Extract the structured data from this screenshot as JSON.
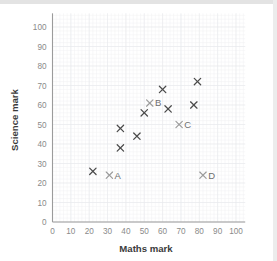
{
  "chart_data": {
    "type": "scatter",
    "title": "",
    "xlabel": "Maths mark",
    "ylabel": "Science mark",
    "xlim": [
      0,
      105
    ],
    "ylim": [
      0,
      107
    ],
    "xticks": [
      0,
      10,
      20,
      30,
      40,
      50,
      60,
      70,
      80,
      90,
      100
    ],
    "yticks": [
      0,
      10,
      20,
      30,
      40,
      50,
      60,
      70,
      80,
      90,
      100
    ],
    "xtick_labels": [
      "0",
      "10",
      "20",
      "30",
      "40",
      "50",
      "60",
      "70",
      "80",
      "90",
      "100"
    ],
    "ytick_labels": [
      "0",
      "10",
      "20",
      "30",
      "40",
      "50",
      "60",
      "70",
      "80",
      "90",
      "100"
    ],
    "grid": true,
    "legend": false,
    "marker": "x",
    "points": [
      {
        "x": 22,
        "y": 26,
        "label": "",
        "style": "dark"
      },
      {
        "x": 31,
        "y": 24,
        "label": "A",
        "style": "light",
        "label_side": "right"
      },
      {
        "x": 37,
        "y": 48,
        "label": "",
        "style": "dark"
      },
      {
        "x": 37,
        "y": 38,
        "label": "",
        "style": "dark"
      },
      {
        "x": 46,
        "y": 44,
        "label": "",
        "style": "dark"
      },
      {
        "x": 50,
        "y": 56,
        "label": "",
        "style": "dark"
      },
      {
        "x": 53,
        "y": 61,
        "label": "B",
        "style": "light",
        "label_side": "right"
      },
      {
        "x": 60,
        "y": 68,
        "label": "",
        "style": "dark"
      },
      {
        "x": 63,
        "y": 58,
        "label": "",
        "style": "dark"
      },
      {
        "x": 69,
        "y": 50,
        "label": "C",
        "style": "light",
        "label_side": "right"
      },
      {
        "x": 77,
        "y": 60,
        "label": "",
        "style": "dark"
      },
      {
        "x": 79,
        "y": 72,
        "label": "",
        "style": "dark"
      },
      {
        "x": 82,
        "y": 24,
        "label": "D",
        "style": "light",
        "label_side": "right"
      }
    ]
  },
  "colors": {
    "marker_dark": "#4a4a4a",
    "marker_light": "#9a9a9a",
    "axis": "#9b9b9b",
    "tick_text": "#8a8a8a",
    "axis_title": "#3b3b3b",
    "grid_minor": "#f0f1f3",
    "grid_major": "#e7e9ec",
    "background": "#ffffff"
  }
}
